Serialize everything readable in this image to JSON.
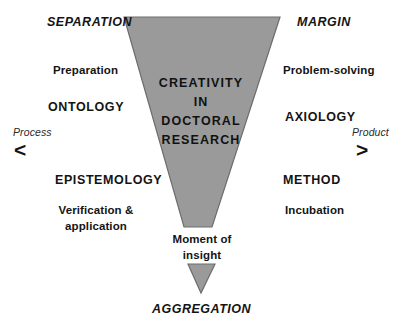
{
  "diagram": {
    "title": "Creativity in Doctoral Research",
    "colors": {
      "funnel_fill": "#9a9a9a",
      "funnel_stroke": "#6d6d6d",
      "text": "#141414",
      "background": "#ffffff"
    },
    "core_label": {
      "lines": [
        "CREATIVITY",
        "IN",
        "DOCTORAL",
        "RESEARCH"
      ]
    },
    "left_column": {
      "stage_heading": "SEPARATION",
      "process_word_top": "Preparation",
      "paradigm": "ONTOLOGY",
      "paradigm_lower": "EPISTEMOLOGY",
      "process_word_bottom": "Verification & application",
      "axis_caption": "Process",
      "axis_arrow": "chevron-left"
    },
    "right_column": {
      "stage_heading": "MARGIN",
      "process_word_top": "Problem-solving",
      "paradigm": "AXIOLOGY",
      "paradigm_lower": "METHOD",
      "process_word_bottom": "Incubation",
      "axis_caption": "Product",
      "axis_arrow": "chevron-right"
    },
    "bottom": {
      "moment_label": "Moment of insight",
      "stage_heading": "AGGREGATION"
    }
  }
}
